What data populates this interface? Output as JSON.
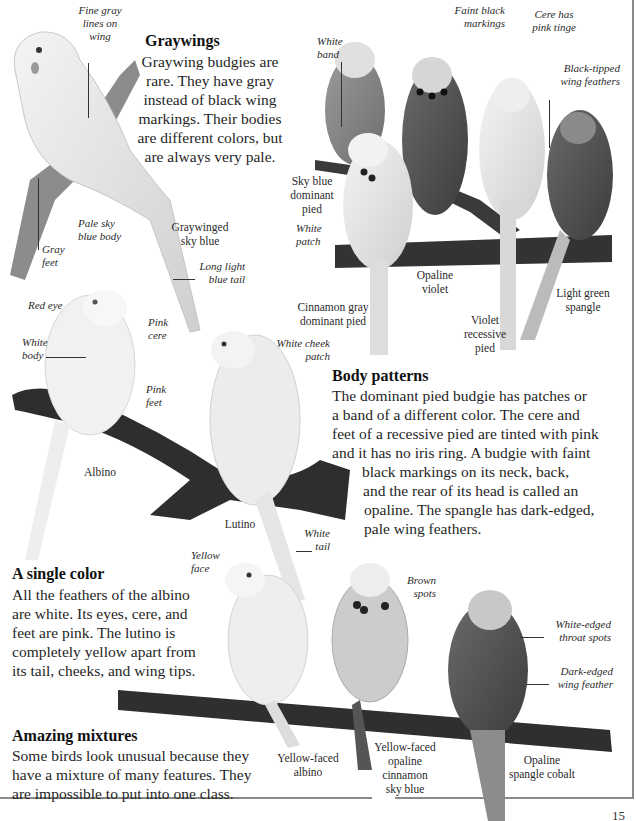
{
  "page": {
    "page_number": "15",
    "colors": {
      "background": "#ffffff",
      "text": "#1f1f1f",
      "frame": "#8a8a8a",
      "branch": "#3a3a3a"
    }
  },
  "sections": {
    "graywings": {
      "heading": "Graywings",
      "lines": [
        "Graywing budgies are",
        "rare. They have gray",
        "instead of black wing",
        "markings. Their bodies",
        "are different colors, but",
        "are always very pale."
      ]
    },
    "body_patterns": {
      "heading": "Body patterns",
      "lines": [
        "The dominant pied budgie has patches or",
        "a band of a different color. The cere and",
        "feet of a recessive pied are tinted with pink",
        "and it has no iris ring. A budgie with faint",
        "black markings on its neck, back,",
        "and the rear of its head is called an",
        "opaline. The spangle has dark-edged,",
        "pale wing feathers."
      ]
    },
    "single_color": {
      "heading": "A single color",
      "lines": [
        "All the feathers of the albino",
        "are white. Its eyes, cere, and",
        "feet are pink. The lutino is",
        "completely yellow apart from",
        "its tail, cheeks, and wing tips."
      ]
    },
    "amazing_mixtures": {
      "heading": "Amazing mixtures",
      "lines": [
        "Some birds look unusual because they",
        "have a mixture of many features. They",
        "are impossible to put into one class."
      ]
    }
  },
  "captions": {
    "graywinged_sky_blue": [
      "Graywinged",
      "sky blue"
    ],
    "sky_blue_dominant_pied": [
      "Sky blue",
      "dominant",
      "pied"
    ],
    "cinnamon_gray_dominant_pied": [
      "Cinnamon gray",
      "dominant pied"
    ],
    "opaline_violet": [
      "Opaline",
      "violet"
    ],
    "violet_recessive_pied": [
      "Violet",
      "recessive",
      "pied"
    ],
    "light_green_spangle": [
      "Light green",
      "spangle"
    ],
    "albino": [
      "Albino"
    ],
    "lutino": [
      "Lutino"
    ],
    "yellow_faced_albino": [
      "Yellow-faced",
      "albino"
    ],
    "yellow_faced_opaline_cinnamon_sky_blue": [
      "Yellow-faced",
      "opaline",
      "cinnamon",
      "sky blue"
    ],
    "opaline_spangle_cobalt": [
      "Opaline",
      "spangle cobalt"
    ]
  },
  "callouts": {
    "fine_gray_lines": [
      "Fine gray",
      "lines on",
      "wing"
    ],
    "pale_sky_blue_body": [
      "Pale sky",
      "blue body"
    ],
    "gray_feet": [
      "Gray",
      "feet"
    ],
    "long_light_blue_tail": [
      "Long light",
      "blue tail"
    ],
    "white_band": [
      "White",
      "band"
    ],
    "faint_black_markings": [
      "Faint black",
      "markings"
    ],
    "cere_pink_tinge": [
      "Cere has",
      "pink tinge"
    ],
    "black_tipped_wing": [
      "Black-tipped",
      "wing feathers"
    ],
    "white_patch": [
      "White",
      "patch"
    ],
    "red_eye": [
      "Red eye"
    ],
    "pink_cere": [
      "Pink",
      "cere"
    ],
    "white_body": [
      "White",
      "body"
    ],
    "pink_feet": [
      "Pink",
      "feet"
    ],
    "white_cheek_patch": [
      "White cheek",
      "patch"
    ],
    "white_tail": [
      "White",
      "tail"
    ],
    "yellow_face": [
      "Yellow",
      "face"
    ],
    "brown_spots": [
      "Brown",
      "spots"
    ],
    "white_edged_throat_spots": [
      "White-edged",
      "throat spots"
    ],
    "dark_edged_wing_feather": [
      "Dark-edged",
      "wing feather"
    ]
  }
}
